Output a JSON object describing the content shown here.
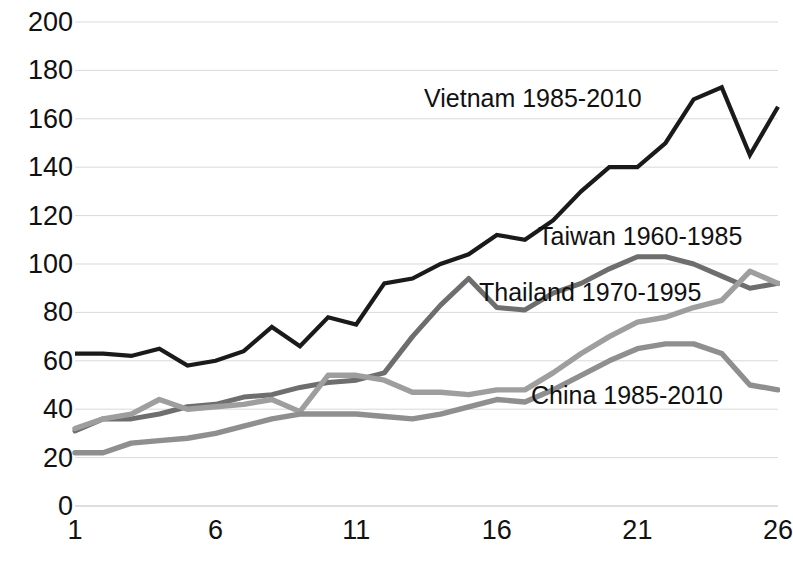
{
  "chart_data": {
    "type": "line",
    "title": "",
    "xlabel": "",
    "ylabel": "",
    "xlim": [
      1,
      26
    ],
    "ylim": [
      0,
      200
    ],
    "grid": true,
    "legend_position": "inline-annotations",
    "x": [
      1,
      2,
      3,
      4,
      5,
      6,
      7,
      8,
      9,
      10,
      11,
      12,
      13,
      14,
      15,
      16,
      17,
      18,
      19,
      20,
      21,
      22,
      23,
      24,
      25,
      26
    ],
    "xticks": [
      "1",
      "6",
      "11",
      "16",
      "21",
      "26"
    ],
    "xtick_values": [
      1,
      6,
      11,
      16,
      21,
      26
    ],
    "yticks": [
      "0",
      "20",
      "40",
      "60",
      "80",
      "100",
      "120",
      "140",
      "160",
      "180",
      "200"
    ],
    "ytick_values": [
      0,
      20,
      40,
      60,
      80,
      100,
      120,
      140,
      160,
      180,
      200
    ],
    "series": [
      {
        "name": "Vietnam 1985-2010",
        "color": "#1a1a1a",
        "label_x": 26.0,
        "label_y": 173.0,
        "values": [
          63,
          63,
          62,
          65,
          58,
          60,
          64,
          74,
          66,
          78,
          75,
          92,
          94,
          100,
          104,
          112,
          110,
          118,
          130,
          140,
          140,
          150,
          168,
          173,
          145,
          165
        ]
      },
      {
        "name": "Taiwan 1960-1985",
        "color": "#6e6e6e",
        "label_x": 26.0,
        "label_y": 103.0,
        "values": [
          31,
          36,
          36,
          38,
          41,
          42,
          45,
          46,
          49,
          51,
          52,
          55,
          70,
          83,
          94,
          82,
          81,
          88,
          92,
          98,
          103,
          103,
          100,
          95,
          90,
          92
        ]
      },
      {
        "name": "Thailand 1970-1995",
        "color": "#9e9e9e",
        "label_x": 25.0,
        "label_y": 97.0,
        "values": [
          32,
          36,
          38,
          44,
          40,
          41,
          42,
          44,
          39,
          54,
          54,
          52,
          47,
          47,
          46,
          48,
          48,
          55,
          63,
          70,
          76,
          78,
          82,
          85,
          97,
          92
        ]
      },
      {
        "name": "China 1985-2010",
        "color": "#8f8f8f",
        "label_x": 23.0,
        "label_y": 67.0,
        "values": [
          22,
          22,
          26,
          27,
          28,
          30,
          33,
          36,
          38,
          38,
          38,
          37,
          36,
          38,
          41,
          44,
          43,
          48,
          54,
          60,
          65,
          67,
          67,
          63,
          50,
          48
        ]
      }
    ],
    "annotations": [
      {
        "text": "Vietnam 1985-2010",
        "x_px": 424,
        "y_px": 84
      },
      {
        "text": "Taiwan 1960-1985",
        "x_px": 538,
        "y_px": 222
      },
      {
        "text": "Thailand 1970-1995",
        "x_px": 479,
        "y_px": 278
      },
      {
        "text": "China 1985-2010",
        "x_px": 531,
        "y_px": 381
      }
    ]
  }
}
